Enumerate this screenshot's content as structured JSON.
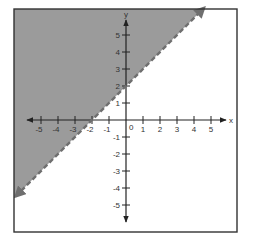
{
  "chart_data": {
    "type": "line",
    "title": "",
    "subtitle": "",
    "xlabel": "x",
    "ylabel": "y",
    "xlim": [
      -5.8,
      6.0
    ],
    "ylim": [
      -5.8,
      5.8
    ],
    "x_ticks": [
      -5,
      -4,
      -3,
      -2,
      -1,
      1,
      2,
      3,
      4,
      5
    ],
    "y_ticks": [
      -5,
      -4,
      -3,
      -2,
      -1,
      1,
      2,
      3,
      4,
      5
    ],
    "x_tick_labels": [
      "-5",
      "-4",
      "-3",
      "-2",
      "-1",
      "1",
      "2",
      "3",
      "4",
      "5"
    ],
    "y_tick_labels": [
      "-5",
      "-4",
      "-3",
      "-2",
      "-1",
      "1",
      "2",
      "3",
      "4",
      "5"
    ],
    "origin_label": "0",
    "grid": false,
    "legend": null,
    "series": [
      {
        "name": "boundary line y = x + 2",
        "style": "dashed",
        "arrows": "both",
        "slope": 1,
        "intercept": 2,
        "points": [
          [
            -6.5,
            -4.5
          ],
          [
            -2,
            0
          ],
          [
            0,
            2
          ],
          [
            4.6,
            6.6
          ]
        ]
      }
    ],
    "shaded_region": {
      "inequality": "y > x + 2",
      "side": "above"
    }
  },
  "colors": {
    "shade": "#9b9b9b",
    "boundary": "#6f6f6f",
    "axis": "#222222",
    "frame": "#333333",
    "background": "#ffffff"
  },
  "layout": {
    "frame": {
      "x": 14,
      "y": 9,
      "w": 223,
      "h": 223
    },
    "origin_px": {
      "x": 126,
      "y": 120
    },
    "unit_px": {
      "x": 17,
      "y": 17
    },
    "x_axis_px": {
      "left": 27,
      "right": 226
    },
    "y_axis_px": {
      "top": 20,
      "bottom": 222
    }
  }
}
